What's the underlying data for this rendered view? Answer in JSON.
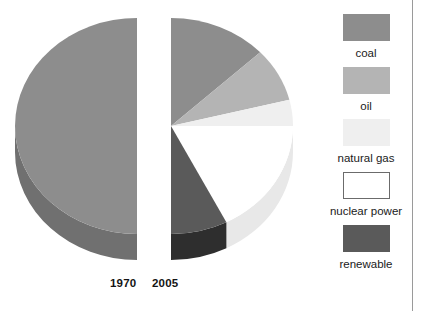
{
  "figure": {
    "name": "energy-source-mix-pie-pair",
    "width": 431,
    "height": 311,
    "background": "#ffffff",
    "rule_color": "#9a9a9a",
    "rule_x": 412
  },
  "legend": {
    "position": "right",
    "items": [
      {
        "label": "coal",
        "color": "#8d8d8d",
        "outlined": false
      },
      {
        "label": "oil",
        "color": "#b4b4b4",
        "outlined": false
      },
      {
        "label": "natural gas",
        "color": "#efefef",
        "outlined": false
      },
      {
        "label": "nuclear power",
        "color": "#ffffff",
        "outlined": true
      },
      {
        "label": "renewable",
        "color": "#5a5a5a",
        "outlined": false
      }
    ]
  },
  "chart_data": {
    "type": "pie",
    "title": "",
    "subtitle": "",
    "xlabel": "",
    "ylabel": "",
    "note": "Two 3-D pies drawn as facing half-discs; 1970 shows only its left half, 2005 only its right half.",
    "categories": [
      "coal",
      "oil",
      "natural gas",
      "nuclear power",
      "renewable"
    ],
    "colors": [
      "#8d8d8d",
      "#b4b4b4",
      "#efefef",
      "#ffffff",
      "#5a5a5a"
    ],
    "side_colors": [
      "#707070",
      "#9c9c9c",
      "#d8d8d8",
      "#e8e8e8",
      "#2e2e2e"
    ],
    "series": [
      {
        "name": "1970",
        "values": [
          68,
          4,
          13,
          2,
          13
        ]
      },
      {
        "name": "2005",
        "values": [
          26,
          14,
          37,
          8,
          15
        ]
      }
    ],
    "legend_position": "right",
    "grid": false
  },
  "pies": [
    {
      "name": "pie-1970",
      "year_label": "1970",
      "half": "left",
      "center": {
        "x": 137,
        "y": 126
      },
      "radius_x": 122,
      "radius_y": 108,
      "depth": 26,
      "slices": [
        {
          "label": "coal",
          "start_deg": 180,
          "end_deg": 360,
          "share_deg": 180,
          "color": "#8d8d8d",
          "side": "#707070"
        },
        {
          "label": "oil",
          "start_deg": 169,
          "end_deg": 180,
          "share_deg": 11,
          "color": "#b4b4b4",
          "side": "#9c9c9c"
        },
        {
          "label": "natural gas",
          "start_deg": 135,
          "end_deg": 169,
          "share_deg": 34,
          "color": "#efefef",
          "side": "#d8d8d8"
        },
        {
          "label": "nuclear power",
          "start_deg": 128,
          "end_deg": 135,
          "share_deg": 7,
          "color": "#ffffff",
          "side": "#e8e8e8"
        },
        {
          "label": "renewable",
          "start_deg": 93,
          "end_deg": 128,
          "share_deg": 35,
          "color": "#5a5a5a",
          "side": "#2e2e2e"
        }
      ]
    },
    {
      "name": "pie-2005",
      "year_label": "2005",
      "half": "right",
      "center": {
        "x": 171,
        "y": 126
      },
      "radius_x": 122,
      "radius_y": 108,
      "depth": 26,
      "slices": [
        {
          "label": "coal",
          "start_deg": 0,
          "end_deg": 47,
          "share_deg": 47,
          "color": "#8d8d8d",
          "side": "#707070"
        },
        {
          "label": "oil",
          "start_deg": 47,
          "end_deg": 76,
          "share_deg": 29,
          "color": "#b4b4b4",
          "side": "#9c9c9c"
        },
        {
          "label": "natural gas",
          "start_deg": 76,
          "end_deg": 90,
          "share_deg": 14,
          "color": "#efefef",
          "side": "#d8d8d8"
        },
        {
          "label": "nuclear power",
          "start_deg": 90,
          "end_deg": 153,
          "share_deg": 63,
          "color": "#ffffff",
          "side": "#e8e8e8"
        },
        {
          "label": "renewable",
          "start_deg": 153,
          "end_deg": 180,
          "share_deg": 27,
          "color": "#5a5a5a",
          "side": "#2e2e2e"
        }
      ]
    }
  ]
}
